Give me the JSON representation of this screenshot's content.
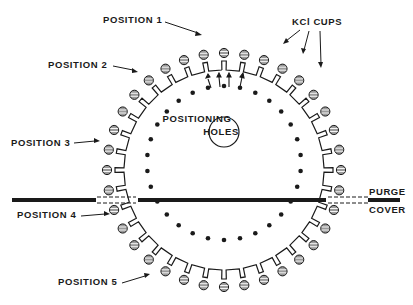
{
  "figure": {
    "labels": {
      "position_1": "POSITION 1",
      "position_2": "POSITION 2",
      "position_3": "POSITION 3",
      "position_4": "POSITION 4",
      "position_5": "POSITION 5",
      "kcl_cups": "KCl CUPS",
      "positioning_holes_line1": "POSITIONING",
      "positioning_holes_line2": "HOLES",
      "purge_cover_line1": "PURGE",
      "purge_cover_line2": "COVER"
    },
    "geometry": {
      "center": [
        224,
        170
      ],
      "cup_radius": 117,
      "cup_count": 36,
      "rim_radius": 100,
      "hole_ring_center": [
        224,
        163
      ],
      "hole_ring_radius": 77,
      "hole_count": 30,
      "center_hole_radius": 15,
      "purge_cover_y": 200
    },
    "colors": {
      "ink": "#1a1a1a",
      "background": "#ffffff",
      "cup_fill": "#9a9a9a"
    }
  }
}
